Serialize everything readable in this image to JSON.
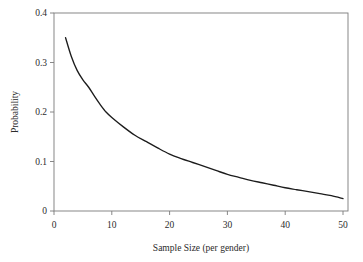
{
  "figure": {
    "truncated_top_text": "",
    "background_color": "#ffffff",
    "frame_color": "#7a7a7a"
  },
  "chart_data": {
    "type": "line",
    "title": "",
    "xlabel": "Sample Size (per gender)",
    "ylabel": "Probability",
    "xlim": [
      0,
      51
    ],
    "ylim": [
      0,
      0.4
    ],
    "xticks": [
      0,
      10,
      20,
      30,
      40,
      50
    ],
    "xtick_labels": [
      "0",
      "10",
      "20",
      "30",
      "40",
      "50"
    ],
    "yticks": [
      0,
      0.1,
      0.2,
      0.3,
      0.4
    ],
    "ytick_labels": [
      "0",
      "0.1",
      "0.2",
      "0.3",
      "0.4"
    ],
    "grid": false,
    "legend": null,
    "line_color": "#1c1c1c",
    "series": [
      {
        "name": "Probability",
        "x": [
          2,
          3,
          4,
          5,
          6,
          7,
          8,
          9,
          10,
          12,
          14,
          16,
          18,
          20,
          22,
          24,
          26,
          28,
          30,
          32,
          34,
          36,
          38,
          40,
          42,
          44,
          46,
          48,
          50
        ],
        "y": [
          0.35,
          0.312,
          0.284,
          0.265,
          0.25,
          0.232,
          0.215,
          0.2,
          0.189,
          0.17,
          0.153,
          0.14,
          0.127,
          0.115,
          0.106,
          0.098,
          0.09,
          0.082,
          0.074,
          0.068,
          0.062,
          0.057,
          0.052,
          0.047,
          0.043,
          0.039,
          0.035,
          0.031,
          0.025
        ]
      }
    ]
  },
  "layout": {
    "plot_left_px": 54,
    "plot_right_px": 348,
    "plot_top_px": 13,
    "plot_bottom_px": 211
  }
}
